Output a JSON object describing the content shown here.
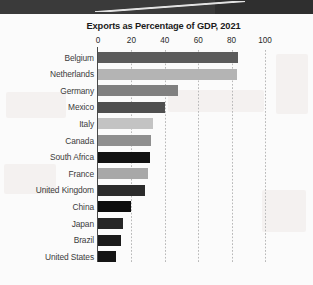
{
  "banner": {
    "name": "top-dark-banner"
  },
  "chart_data": {
    "type": "bar",
    "orientation": "horizontal",
    "title": "Exports as Percentage of GDP, 2021",
    "xlabel": "",
    "ylabel": "",
    "xlim": [
      0,
      100
    ],
    "xticks": [
      0,
      20,
      40,
      60,
      80,
      100
    ],
    "xtick_labels": [
      "0",
      "20",
      "40",
      "60",
      "80",
      "100"
    ],
    "grid": "vertical-dotted",
    "legend": "none",
    "categories": [
      "Belgium",
      "Netherlands",
      "Germany",
      "Mexico",
      "Italy",
      "Canada",
      "South Africa",
      "France",
      "United Kingdom",
      "China",
      "Japan",
      "Brazil",
      "United States"
    ],
    "values": [
      84,
      83,
      48,
      40,
      33,
      32,
      31,
      30,
      28,
      20,
      15,
      14,
      11
    ],
    "bar_colors": [
      "#5b5b5b",
      "#b4b4b4",
      "#808080",
      "#4f4f4f",
      "#c3c3c3",
      "#8f8f8f",
      "#121212",
      "#a8a8a8",
      "#2b2b2b",
      "#0d0d0d",
      "#262626",
      "#1a1a1a",
      "#151515"
    ]
  },
  "colors": {
    "banner": "#3a3a3a",
    "page": "#fbfbfb",
    "axis": "#4a4a4a",
    "gridline": "#b9b9b9",
    "title_text": "#1b1b1b",
    "label_text": "#3b3b3b"
  }
}
